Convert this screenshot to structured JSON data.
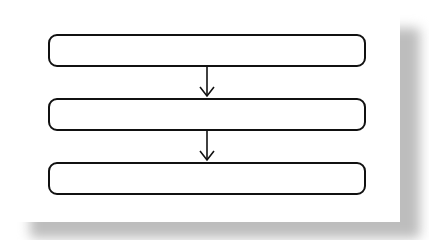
{
  "diagram": {
    "type": "flowchart",
    "direction": "top-to-bottom",
    "nodes": [
      {
        "id": "step-1",
        "label": ""
      },
      {
        "id": "step-2",
        "label": ""
      },
      {
        "id": "step-3",
        "label": ""
      }
    ],
    "edges": [
      {
        "from": "step-1",
        "to": "step-2"
      },
      {
        "from": "step-2",
        "to": "step-3"
      }
    ],
    "colors": {
      "stroke": "#111111",
      "background": "#ffffff",
      "shadow": "#bdbdbd"
    }
  }
}
